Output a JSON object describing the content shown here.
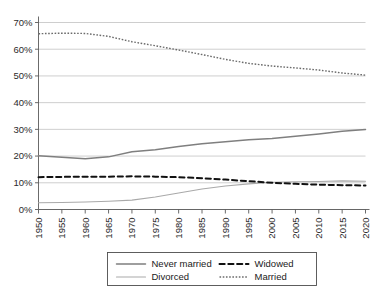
{
  "chart_data": {
    "type": "line",
    "title": "",
    "subtitle": "",
    "xlabel": "",
    "ylabel": "",
    "xlim": [
      1950,
      2020
    ],
    "ylim": [
      0,
      70
    ],
    "grid": true,
    "legend_position": "bottom",
    "x_tick_labels": [
      "1950",
      "1955",
      "1960",
      "1965",
      "1970",
      "1975",
      "1980",
      "1985",
      "1990",
      "1995",
      "2000",
      "2005",
      "2010",
      "2015",
      "2020"
    ],
    "x_ticks": [
      1950,
      1955,
      1960,
      1965,
      1970,
      1975,
      1980,
      1985,
      1990,
      1995,
      2000,
      2005,
      2010,
      2015,
      2020
    ],
    "y_tick_labels": [
      "0%",
      "10%",
      "20%",
      "30%",
      "40%",
      "50%",
      "60%",
      "70%"
    ],
    "y_ticks": [
      0,
      10,
      20,
      30,
      40,
      50,
      60,
      70
    ],
    "x": [
      1950,
      1955,
      1960,
      1965,
      1970,
      1975,
      1980,
      1985,
      1990,
      1995,
      2000,
      2005,
      2010,
      2015,
      2020
    ],
    "series": [
      {
        "name": "Never married",
        "style": "solid",
        "color": "#7f7f7f",
        "width": 1.5,
        "values": [
          20.1,
          19.6,
          19.0,
          19.7,
          21.6,
          22.4,
          23.6,
          24.6,
          25.4,
          26.1,
          26.6,
          27.4,
          28.3,
          29.3,
          29.9
        ]
      },
      {
        "name": "Divorced",
        "style": "solid",
        "color": "#a9a9a9",
        "width": 1.1,
        "values": [
          2.5,
          2.6,
          2.8,
          3.1,
          3.5,
          4.7,
          6.2,
          7.7,
          8.8,
          9.6,
          10.2,
          10.4,
          10.5,
          10.7,
          10.6
        ]
      },
      {
        "name": "Widowed",
        "style": "dashed",
        "color": "#111111",
        "width": 2.0,
        "values": [
          12.1,
          12.2,
          12.3,
          12.3,
          12.4,
          12.3,
          12.1,
          11.7,
          11.2,
          10.6,
          10.0,
          9.6,
          9.3,
          9.1,
          9.0
        ]
      },
      {
        "name": "Married",
        "style": "dotted",
        "color": "#6b6b6b",
        "width": 1.4,
        "values": [
          65.8,
          66.0,
          65.9,
          64.8,
          62.8,
          61.3,
          59.7,
          58.0,
          56.2,
          54.7,
          53.7,
          53.0,
          52.2,
          51.1,
          50.3
        ]
      }
    ]
  },
  "legend": {
    "entries": [
      {
        "label": "Never married",
        "sample": "solid-dark-line-sample"
      },
      {
        "label": "Widowed",
        "sample": "dashed-line-sample"
      },
      {
        "label": "Divorced",
        "sample": "solid-light-line-sample"
      },
      {
        "label": "Married",
        "sample": "dotted-line-sample"
      }
    ]
  },
  "colors": {
    "background": "#ffffff",
    "gridline": "#b9b9b9",
    "axis": "#5a5a5a",
    "never_married": "#7f7f7f",
    "divorced": "#a9a9a9",
    "widowed": "#111111",
    "married": "#6b6b6b"
  }
}
